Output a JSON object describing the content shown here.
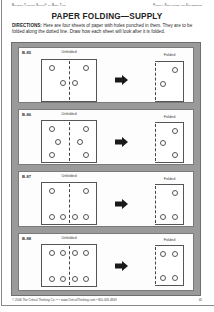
{
  "header": {
    "left": "Building Thinking Skills® — Book Two",
    "right": "Figural Similarities and Differences"
  },
  "title": "PAPER FOLDING—SUPPLY",
  "directions": {
    "label": "DIRECTIONS:",
    "text": " Here are four sheets of paper with holes punched in them. They are to be folded along the dotted line. Draw how each sheet will look after it is folded."
  },
  "labels": {
    "unfolded": "Unfolded",
    "folded": "Folded"
  },
  "exercises": [
    {
      "id": "B-85",
      "unfolded_holes": [
        [
          0.18,
          0.2
        ],
        [
          0.82,
          0.2
        ],
        [
          0.38,
          0.56
        ],
        [
          0.62,
          0.56
        ]
      ],
      "folded_holes": [
        [
          0.72,
          0.2
        ],
        [
          0.28,
          0.56
        ]
      ]
    },
    {
      "id": "B-86",
      "unfolded_holes": [
        [
          0.18,
          0.2
        ],
        [
          0.82,
          0.2
        ],
        [
          0.3,
          0.5
        ],
        [
          0.7,
          0.5
        ],
        [
          0.18,
          0.82
        ],
        [
          0.82,
          0.82
        ]
      ],
      "folded_holes": [
        [
          0.72,
          0.2
        ],
        [
          0.3,
          0.5
        ],
        [
          0.72,
          0.82
        ]
      ]
    },
    {
      "id": "B-87",
      "unfolded_holes": [
        [
          0.18,
          0.2
        ],
        [
          0.82,
          0.2
        ],
        [
          0.18,
          0.82
        ],
        [
          0.38,
          0.82
        ],
        [
          0.62,
          0.82
        ],
        [
          0.82,
          0.82
        ]
      ],
      "folded_holes": [
        [
          0.72,
          0.2
        ],
        [
          0.3,
          0.82
        ],
        [
          0.72,
          0.82
        ]
      ]
    },
    {
      "id": "B-88",
      "unfolded_holes": [
        [
          0.18,
          0.2
        ],
        [
          0.38,
          0.2
        ],
        [
          0.62,
          0.2
        ],
        [
          0.82,
          0.2
        ],
        [
          0.18,
          0.82
        ],
        [
          0.38,
          0.82
        ],
        [
          0.62,
          0.82
        ],
        [
          0.82,
          0.82
        ]
      ],
      "folded_holes": [
        [
          0.3,
          0.2
        ],
        [
          0.72,
          0.2
        ],
        [
          0.3,
          0.82
        ],
        [
          0.72,
          0.82
        ]
      ]
    }
  ],
  "footer": {
    "text": "© 2006 The Critical Thinking Co.™ • www.CriticalThinking.com • 800-458-4849",
    "page_number": "45"
  },
  "colors": {
    "frame": "#9a9a9a",
    "panel": "#fdfdfd",
    "arrow": "#1a1a1a"
  }
}
